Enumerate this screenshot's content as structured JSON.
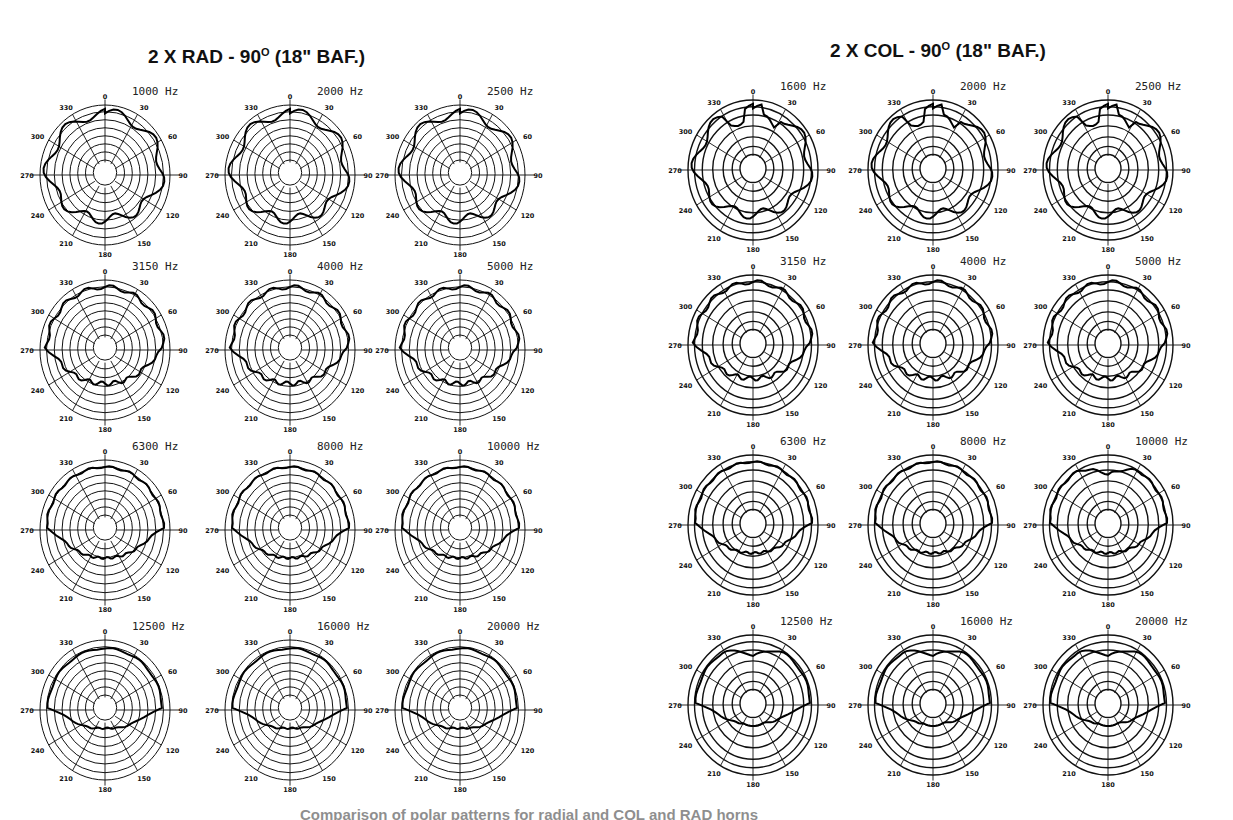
{
  "groups": [
    {
      "title_prefix": "2 X RAD - 90",
      "title_sup": "O",
      "title_suffix": " (18\" BAF.)",
      "style": "rad",
      "panels": [
        {
          "freq": "1000 Hz"
        },
        {
          "freq": "2000 Hz"
        },
        {
          "freq": "2500 Hz"
        },
        {
          "freq": "3150 Hz"
        },
        {
          "freq": "4000 Hz"
        },
        {
          "freq": "5000 Hz"
        },
        {
          "freq": "6300 Hz"
        },
        {
          "freq": "8000 Hz"
        },
        {
          "freq": "10000 Hz"
        },
        {
          "freq": "12500 Hz"
        },
        {
          "freq": "16000 Hz"
        },
        {
          "freq": "20000 Hz"
        }
      ]
    },
    {
      "title_prefix": "2 X COL - 90",
      "title_sup": "O",
      "title_suffix": " (18\" BAF.)",
      "style": "col",
      "panels": [
        {
          "freq": "1600 Hz"
        },
        {
          "freq": "2000 Hz"
        },
        {
          "freq": "2500 Hz"
        },
        {
          "freq": "3150 Hz"
        },
        {
          "freq": "4000 Hz"
        },
        {
          "freq": "5000 Hz"
        },
        {
          "freq": "6300 Hz"
        },
        {
          "freq": "8000 Hz"
        },
        {
          "freq": "10000 Hz"
        },
        {
          "freq": "12500 Hz"
        },
        {
          "freq": "16000 Hz"
        },
        {
          "freq": "20000 Hz"
        }
      ]
    }
  ],
  "caption": "Comparison of polar patterns for radial and COL and RAD horns",
  "chart_data": {
    "type": "polar",
    "angle_labels": [
      "0",
      "30",
      "60",
      "90",
      "120",
      "150",
      "180",
      "210",
      "240",
      "270",
      "300",
      "330"
    ],
    "angle_unit": "degrees",
    "grid": true,
    "layout": "two groups of 4x3 small-multiple polar plots",
    "series": [
      {
        "name": "2 X RAD - 90° (18\" BAF.)",
        "frequencies_hz": [
          1000,
          2000,
          2500,
          3150,
          4000,
          5000,
          6300,
          8000,
          10000,
          12500,
          16000,
          20000
        ],
        "approx_coverage_desc": "wide ~180° front coverage at low freqs with lobing; flat-topped ~120-150° patterns mid-band; narrowing to ~120° at 12.5-20 kHz"
      },
      {
        "name": "2 X COL - 90° (18\" BAF.)",
        "frequencies_hz": [
          1600,
          2000,
          2500,
          3150,
          4000,
          5000,
          6300,
          8000,
          10000,
          12500,
          16000,
          20000
        ],
        "approx_coverage_desc": "wide front coverage with lobing at low freqs; flat-topped mid-band; pronounced on-axis dip/heart-shaped pattern at 10-20 kHz"
      }
    ]
  }
}
